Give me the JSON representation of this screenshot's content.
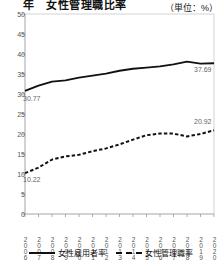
{
  "header": {
    "title": "年　女性管理職比率",
    "unit_note": "（単位：%）"
  },
  "legend": {
    "items": [
      {
        "label": "女性雇用者率",
        "style": "solid"
      },
      {
        "label": "女性管理職率",
        "style": "dashed"
      }
    ]
  },
  "annotations": {
    "employee_start": "30.77",
    "employee_end": "37.69",
    "manager_start": "10.22",
    "manager_end": "20.92"
  },
  "chart_data": {
    "type": "line",
    "title": "年　女性管理職比率",
    "subtitle": "（単位：%）",
    "xlabel": "",
    "ylabel": "",
    "unit": "%",
    "grid": false,
    "legend_position": "bottom",
    "ylim": [
      0,
      50
    ],
    "yticks": [
      0,
      5,
      10,
      15,
      20,
      25,
      30,
      35,
      40,
      45,
      50
    ],
    "categories": [
      "2006",
      "2007",
      "2008",
      "2009",
      "2010",
      "2011",
      "2012",
      "2013",
      "2014",
      "2015",
      "2016",
      "2017",
      "2018",
      "2019",
      "2020"
    ],
    "series": [
      {
        "name": "女性雇用者率",
        "style": "solid",
        "color": "#111111",
        "values": [
          30.77,
          32.1,
          33.1,
          33.4,
          34.1,
          34.6,
          35.1,
          35.8,
          36.3,
          36.6,
          36.9,
          37.4,
          38.1,
          37.6,
          37.69
        ],
        "labels": {
          "first": "30.77",
          "last": "37.69"
        }
      },
      {
        "name": "女性管理職率",
        "style": "dashed",
        "color": "#111111",
        "values": [
          10.22,
          11.6,
          13.6,
          14.4,
          14.8,
          15.7,
          16.4,
          17.4,
          18.6,
          19.7,
          20.1,
          20.1,
          19.4,
          20.0,
          20.92
        ],
        "labels": {
          "first": "10.22",
          "last": "20.92"
        }
      }
    ]
  }
}
